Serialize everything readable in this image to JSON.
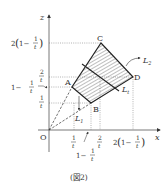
{
  "figure": {
    "caption": "(図2)",
    "axes": {
      "x_label": "x",
      "z_label": "z",
      "origin_label": "O"
    },
    "points": {
      "A": "A",
      "B": "B",
      "C": "C",
      "D": "D"
    },
    "lines": {
      "L1": "L",
      "L1_sub": "1",
      "L2": "L",
      "L2_sub": "2",
      "Lt": "L",
      "Lt_sub": "t"
    },
    "z_ticks": {
      "two_one_minus": {
        "pre": "2",
        "open": "(",
        "one": "1−",
        "num": "1",
        "den": "t",
        "close": ")"
      },
      "two_over_t": {
        "num": "2",
        "den": "t"
      },
      "one_minus": {
        "one": "1−",
        "num": "1",
        "den": "t"
      },
      "one_over_t": {
        "num": "1",
        "den": "t"
      }
    },
    "x_ticks": {
      "one_over_t": {
        "num": "1",
        "den": "t"
      },
      "two_over_t": {
        "num": "2",
        "den": "t"
      },
      "one_minus": {
        "one": "1−",
        "num": "1",
        "den": "t"
      },
      "two_one_minus": {
        "pre": "2",
        "open": "(",
        "one": "1−",
        "num": "1",
        "den": "t",
        "close": ")"
      }
    }
  }
}
